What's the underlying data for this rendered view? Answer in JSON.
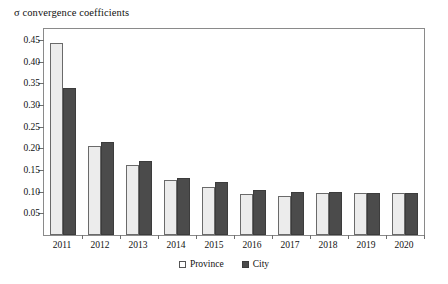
{
  "chart_data": {
    "type": "bar",
    "title": "σ convergence coefficients",
    "xlabel": "",
    "ylabel": "",
    "ylim": [
      0,
      0.475
    ],
    "grid": false,
    "legend_position": "bottom-center",
    "categories": [
      "2011",
      "2012",
      "2013",
      "2014",
      "2015",
      "2016",
      "2017",
      "2018",
      "2019",
      "2020"
    ],
    "yticks": [
      "0.05",
      "0.10",
      "0.15",
      "0.20",
      "0.25",
      "0.30",
      "0.35",
      "0.40",
      "0.45"
    ],
    "ytick_values": [
      0.05,
      0.1,
      0.15,
      0.2,
      0.25,
      0.3,
      0.35,
      0.4,
      0.45
    ],
    "series": [
      {
        "name": "Province",
        "color": "#ececec",
        "values": [
          0.442,
          0.205,
          0.162,
          0.127,
          0.111,
          0.095,
          0.091,
          0.096,
          0.097,
          0.096
        ]
      },
      {
        "name": "City",
        "color": "#4b4b4b",
        "values": [
          0.34,
          0.215,
          0.17,
          0.132,
          0.122,
          0.104,
          0.1,
          0.099,
          0.098,
          0.097
        ]
      }
    ]
  },
  "legend": {
    "items": [
      {
        "label": "Province",
        "swatch": "province-swatch-icon"
      },
      {
        "label": "City",
        "swatch": "city-swatch-icon"
      }
    ]
  }
}
